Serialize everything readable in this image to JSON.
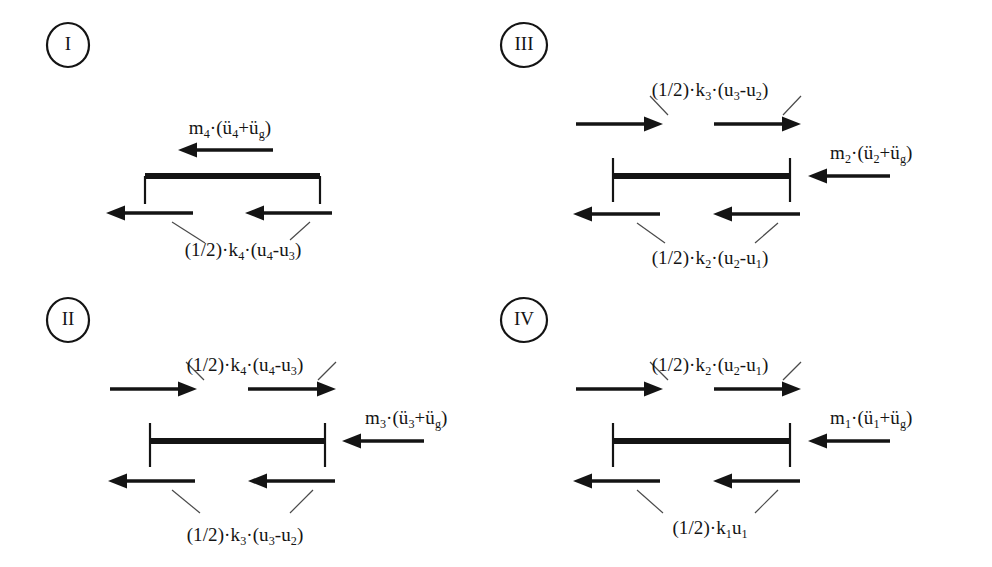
{
  "figure": {
    "background_color": "#ffffff",
    "ink_color": "#141414",
    "leader_color": "#4a4a4a"
  },
  "panels": [
    {
      "id": "panel-1",
      "marker": "I",
      "marker_cx": 68,
      "marker_cy": 45,
      "marker_rx": 21,
      "marker_ry": 22,
      "beam": {
        "x1": 145,
        "x2": 320,
        "y": 176,
        "thickness": 6
      },
      "beam_end_style": "bracket-down",
      "tick_top": 0,
      "tick_bottom": 28,
      "inertia_force": {
        "label": "m4(u4+ug)",
        "label_html": "m<sub>4</sub>·(ü<sub>4</sub>+ü<sub>g</sub>)",
        "label_x": 230,
        "label_y": 118,
        "anchor": "mid",
        "arrow": {
          "x_tail": 273,
          "x_head": 178,
          "y": 150,
          "direction": "left"
        },
        "position": "on-beam"
      },
      "spring_force_top": null,
      "spring_force_bottom": {
        "label": "(1/2)k4(u4-u3)",
        "label_html": "(1/2)·k<sub>4</sub>·(u<sub>4</sub>-u<sub>3</sub>)",
        "label_x": 243,
        "label_y": 240,
        "anchor": "mid",
        "arrows": [
          {
            "x_tail": 193,
            "x_head": 106,
            "y": 213,
            "direction": "left"
          },
          {
            "x_tail": 332,
            "x_head": 245,
            "y": 213,
            "direction": "left"
          }
        ],
        "leaders": [
          {
            "x1": 172,
            "y1": 222,
            "x2": 205,
            "y2": 243
          },
          {
            "x1": 310,
            "y1": 222,
            "x2": 290,
            "y2": 240
          }
        ]
      }
    },
    {
      "id": "panel-2",
      "marker": "II",
      "marker_cx": 68,
      "marker_cy": 320,
      "marker_rx": 21,
      "marker_ry": 22,
      "beam": {
        "x1": 150,
        "x2": 325,
        "y": 441,
        "thickness": 6
      },
      "beam_end_style": "cross",
      "tick_top": 18,
      "tick_bottom": 26,
      "inertia_force": {
        "label": "m3(u3+ug)",
        "label_html": "m<sub>3</sub>·(ü<sub>3</sub>+ü<sub>g</sub>)",
        "label_x": 365,
        "label_y": 408,
        "anchor": "left",
        "arrow": {
          "x_tail": 424,
          "x_head": 342,
          "y": 441,
          "direction": "left"
        },
        "position": "right-of-beam"
      },
      "spring_force_top": {
        "label": "(1/2)k4(u4-u3)",
        "label_html": "(1/2)·k<sub>4</sub>·(u<sub>4</sub>-u<sub>3</sub>)",
        "label_x": 245,
        "label_y": 355,
        "anchor": "mid",
        "arrows": [
          {
            "x_tail": 110,
            "x_head": 197,
            "y": 389,
            "direction": "right"
          },
          {
            "x_tail": 248,
            "x_head": 336,
            "y": 389,
            "direction": "right"
          }
        ],
        "leaders": [
          {
            "x1": 204,
            "y1": 380,
            "x2": 186,
            "y2": 362
          },
          {
            "x1": 318,
            "y1": 380,
            "x2": 336,
            "y2": 362
          }
        ]
      },
      "spring_force_bottom": {
        "label": "(1/2)k3(u3-u2)",
        "label_html": "(1/2)·k<sub>3</sub>·(u<sub>3</sub>-u<sub>2</sub>)",
        "label_x": 245,
        "label_y": 525,
        "anchor": "mid",
        "arrows": [
          {
            "x_tail": 195,
            "x_head": 108,
            "y": 481,
            "direction": "left"
          },
          {
            "x_tail": 335,
            "x_head": 248,
            "y": 481,
            "direction": "left"
          }
        ],
        "leaders": [
          {
            "x1": 172,
            "y1": 490,
            "x2": 200,
            "y2": 513
          },
          {
            "x1": 313,
            "y1": 490,
            "x2": 290,
            "y2": 513
          }
        ]
      }
    },
    {
      "id": "panel-3",
      "marker": "III",
      "marker_cx": 524,
      "marker_cy": 45,
      "marker_rx": 23,
      "marker_ry": 22,
      "beam": {
        "x1": 613,
        "x2": 790,
        "y": 176,
        "thickness": 6
      },
      "beam_end_style": "cross",
      "tick_top": 18,
      "tick_bottom": 26,
      "inertia_force": {
        "label": "m2(u2+ug)",
        "label_html": "m<sub>2</sub>·(ü<sub>2</sub>+ü<sub>g</sub>)",
        "label_x": 830,
        "label_y": 143,
        "anchor": "left",
        "arrow": {
          "x_tail": 890,
          "x_head": 808,
          "y": 176,
          "direction": "left"
        },
        "position": "right-of-beam"
      },
      "spring_force_top": {
        "label": "(1/2)k3(u3-u2)",
        "label_html": "(1/2)·k<sub>3</sub>·(u<sub>3</sub>-u<sub>2</sub>)",
        "label_x": 710,
        "label_y": 80,
        "anchor": "mid",
        "arrows": [
          {
            "x_tail": 576,
            "x_head": 663,
            "y": 124,
            "direction": "right"
          },
          {
            "x_tail": 714,
            "x_head": 801,
            "y": 124,
            "direction": "right"
          }
        ],
        "leaders": [
          {
            "x1": 668,
            "y1": 115,
            "x2": 650,
            "y2": 96
          },
          {
            "x1": 783,
            "y1": 115,
            "x2": 801,
            "y2": 96
          }
        ]
      },
      "spring_force_bottom": {
        "label": "(1/2)k2(u2-u1)",
        "label_html": "(1/2)·k<sub>2</sub>·(u<sub>2</sub>-u<sub>1</sub>)",
        "label_x": 710,
        "label_y": 248,
        "anchor": "mid",
        "arrows": [
          {
            "x_tail": 660,
            "x_head": 573,
            "y": 214,
            "direction": "left"
          },
          {
            "x_tail": 800,
            "x_head": 713,
            "y": 214,
            "direction": "left"
          }
        ],
        "leaders": [
          {
            "x1": 637,
            "y1": 223,
            "x2": 665,
            "y2": 243
          },
          {
            "x1": 778,
            "y1": 223,
            "x2": 755,
            "y2": 243
          }
        ]
      }
    },
    {
      "id": "panel-4",
      "marker": "IV",
      "marker_cx": 524,
      "marker_cy": 320,
      "marker_rx": 23,
      "marker_ry": 22,
      "beam": {
        "x1": 613,
        "x2": 790,
        "y": 441,
        "thickness": 6
      },
      "beam_end_style": "cross",
      "tick_top": 18,
      "tick_bottom": 26,
      "inertia_force": {
        "label": "m1(u1+ug)",
        "label_html": "m<sub>1</sub>·(ü<sub>1</sub>+ü<sub>g</sub>)",
        "label_x": 830,
        "label_y": 408,
        "anchor": "left",
        "arrow": {
          "x_tail": 890,
          "x_head": 808,
          "y": 441,
          "direction": "left"
        },
        "position": "right-of-beam"
      },
      "spring_force_top": {
        "label": "(1/2)k2(u2-u1)",
        "label_html": "(1/2)·k<sub>2</sub>·(u<sub>2</sub>-u<sub>1</sub>)",
        "label_x": 710,
        "label_y": 355,
        "anchor": "mid",
        "arrows": [
          {
            "x_tail": 576,
            "x_head": 663,
            "y": 389,
            "direction": "right"
          },
          {
            "x_tail": 714,
            "x_head": 801,
            "y": 389,
            "direction": "right"
          }
        ],
        "leaders": [
          {
            "x1": 668,
            "y1": 380,
            "x2": 650,
            "y2": 362
          },
          {
            "x1": 783,
            "y1": 380,
            "x2": 801,
            "y2": 362
          }
        ]
      },
      "spring_force_bottom": {
        "label": "(1/2)k1u1",
        "label_html": "(1/2)·k<sub>1</sub>u<sub>1</sub>",
        "label_x": 710,
        "label_y": 518,
        "anchor": "mid",
        "arrows": [
          {
            "x_tail": 660,
            "x_head": 573,
            "y": 481,
            "direction": "left"
          },
          {
            "x_tail": 800,
            "x_head": 713,
            "y": 481,
            "direction": "left"
          }
        ],
        "leaders": [
          {
            "x1": 637,
            "y1": 490,
            "x2": 663,
            "y2": 513
          },
          {
            "x1": 778,
            "y1": 490,
            "x2": 755,
            "y2": 513
          }
        ]
      }
    }
  ]
}
